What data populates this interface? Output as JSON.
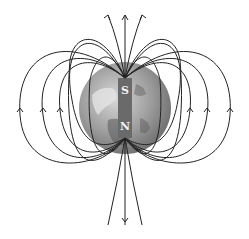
{
  "diagram": {
    "magnet": {
      "top_pole_label": "S",
      "bottom_pole_label": "N",
      "color": "#6a6a6a"
    },
    "globe": {
      "center": [
        125,
        108
      ],
      "radius": 46,
      "color": "#9a9a9a"
    },
    "field_lines": {
      "count_per_side": 7,
      "color": "#222222",
      "direction": "out of bottom pole (N), into top pole (S)"
    }
  }
}
